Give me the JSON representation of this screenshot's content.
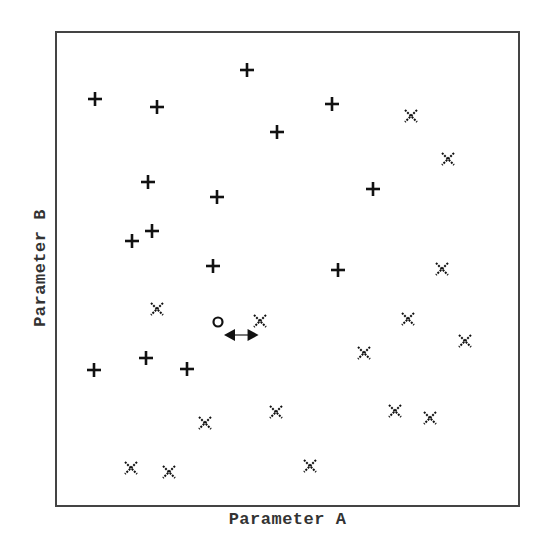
{
  "chart_data": {
    "type": "scatter",
    "title": "",
    "xlabel": "Parameter A",
    "ylabel": "Parameter B",
    "xlim": [
      0,
      100
    ],
    "ylim": [
      0,
      100
    ],
    "grid": false,
    "axis_ticks": false,
    "series": [
      {
        "name": "plus-class",
        "marker": "+",
        "points": [
          {
            "x": 8.2,
            "y": 86.1
          },
          {
            "x": 21.6,
            "y": 84.4
          },
          {
            "x": 41.3,
            "y": 92.2
          },
          {
            "x": 47.7,
            "y": 79.1
          },
          {
            "x": 59.6,
            "y": 85.0
          },
          {
            "x": 68.5,
            "y": 66.9
          },
          {
            "x": 19.7,
            "y": 68.4
          },
          {
            "x": 34.8,
            "y": 65.2
          },
          {
            "x": 20.7,
            "y": 58.0
          },
          {
            "x": 16.2,
            "y": 55.9
          },
          {
            "x": 33.9,
            "y": 50.6
          },
          {
            "x": 60.9,
            "y": 49.8
          },
          {
            "x": 19.2,
            "y": 31.2
          },
          {
            "x": 8.0,
            "y": 28.5
          },
          {
            "x": 28.3,
            "y": 28.9
          }
        ]
      },
      {
        "name": "x-class",
        "marker": "x",
        "points": [
          {
            "x": 76.7,
            "y": 82.5
          },
          {
            "x": 84.9,
            "y": 73.2
          },
          {
            "x": 83.6,
            "y": 50.0
          },
          {
            "x": 21.6,
            "y": 41.6
          },
          {
            "x": 44.0,
            "y": 39.0
          },
          {
            "x": 76.2,
            "y": 39.5
          },
          {
            "x": 88.6,
            "y": 34.8
          },
          {
            "x": 66.7,
            "y": 32.3
          },
          {
            "x": 32.2,
            "y": 17.3
          },
          {
            "x": 47.5,
            "y": 19.8
          },
          {
            "x": 73.4,
            "y": 20.0
          },
          {
            "x": 81.0,
            "y": 18.4
          },
          {
            "x": 16.0,
            "y": 7.8
          },
          {
            "x": 24.4,
            "y": 6.9
          },
          {
            "x": 54.9,
            "y": 8.2
          }
        ]
      },
      {
        "name": "query-point",
        "marker": "o",
        "points": [
          {
            "x": 35.0,
            "y": 38.8
          }
        ]
      }
    ],
    "annotations": [
      {
        "type": "double-arrow",
        "from": {
          "x": 36.3,
          "y": 36.1
        },
        "to": {
          "x": 43.8,
          "y": 36.1
        },
        "description": "distance between query point and nearest x"
      }
    ]
  },
  "axes": {
    "xlabel": "Parameter A",
    "ylabel": "Parameter B"
  },
  "colors": {
    "marker": "#111111",
    "frame": "#444444",
    "label": "#333333"
  }
}
